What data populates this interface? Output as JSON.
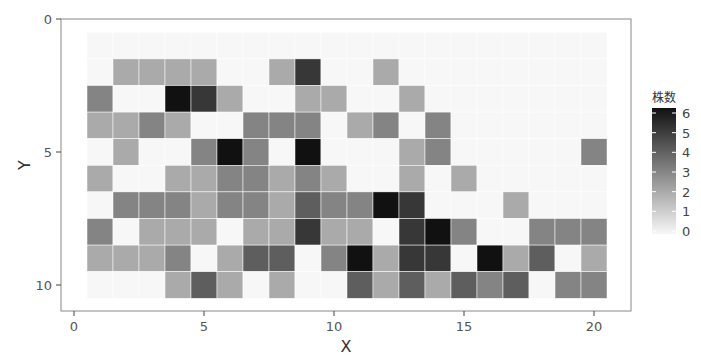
{
  "chart_data": {
    "type": "heatmap",
    "title": "",
    "xlabel": "X",
    "ylabel": "Y",
    "xlim": [
      0,
      21
    ],
    "ylim": [
      0,
      11
    ],
    "y_reversed": true,
    "x_ticks": [
      0,
      5,
      10,
      15,
      20
    ],
    "y_ticks": [
      0,
      5,
      10
    ],
    "x_tick_labels": [
      "0",
      "5",
      "10",
      "15",
      "20"
    ],
    "y_tick_labels": [
      "0",
      "5",
      "10"
    ],
    "x_values": [
      1,
      2,
      3,
      4,
      5,
      6,
      7,
      8,
      9,
      10,
      11,
      12,
      13,
      14,
      15,
      16,
      17,
      18,
      19,
      20
    ],
    "y_values": [
      1,
      2,
      3,
      4,
      5,
      6,
      7,
      8,
      9,
      10
    ],
    "z": [
      [
        0,
        0,
        0,
        0,
        0,
        0,
        0,
        0,
        0,
        0,
        0,
        0,
        0,
        0,
        0,
        0,
        0,
        0,
        0,
        0
      ],
      [
        0,
        2,
        2,
        2,
        2,
        0,
        0,
        2,
        5,
        0,
        0,
        2,
        0,
        0,
        0,
        0,
        0,
        0,
        0,
        0
      ],
      [
        3,
        0,
        0,
        6,
        5,
        2,
        0,
        0,
        2,
        2,
        0,
        0,
        2,
        0,
        0,
        0,
        0,
        0,
        0,
        0
      ],
      [
        2,
        2,
        3,
        2,
        0,
        0,
        3,
        3,
        3,
        0,
        2,
        3,
        0,
        3,
        0,
        0,
        0,
        0,
        0,
        0
      ],
      [
        0,
        2,
        0,
        0,
        3,
        6,
        3,
        0,
        6,
        0,
        0,
        0,
        2,
        3,
        0,
        0,
        0,
        0,
        0,
        3
      ],
      [
        2,
        0,
        0,
        2,
        2,
        3,
        3,
        2,
        3,
        2,
        0,
        0,
        2,
        0,
        2,
        0,
        0,
        0,
        0,
        0
      ],
      [
        0,
        3,
        3,
        3,
        2,
        3,
        3,
        2,
        4,
        3,
        3,
        6,
        5,
        0,
        0,
        0,
        2,
        0,
        0,
        0
      ],
      [
        3,
        0,
        2,
        2,
        2,
        0,
        2,
        2,
        5,
        2,
        2,
        0,
        5,
        6,
        3,
        0,
        0,
        3,
        3,
        3
      ],
      [
        2,
        2,
        2,
        3,
        0,
        2,
        4,
        4,
        0,
        3,
        6,
        2,
        5,
        5,
        0,
        6,
        2,
        4,
        0,
        2
      ],
      [
        0,
        0,
        0,
        2,
        4,
        2,
        0,
        2,
        0,
        0,
        4,
        2,
        4,
        2,
        4,
        3,
        4,
        0,
        3,
        3
      ]
    ],
    "legend": {
      "title": "株数",
      "min": 0,
      "max": 6,
      "ticks": [
        0,
        1,
        2,
        3,
        4,
        5,
        6
      ],
      "tick_labels": [
        "0",
        "1",
        "2",
        "3",
        "4",
        "5",
        "6"
      ],
      "low_color": "#f7f7f7",
      "high_color": "#111111",
      "placement": "right"
    },
    "grid": true
  }
}
